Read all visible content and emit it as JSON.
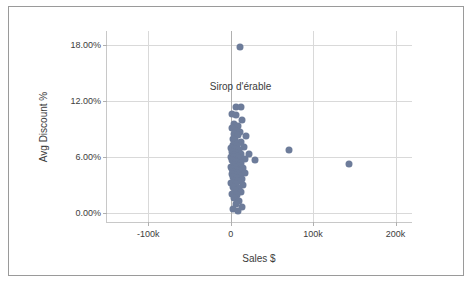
{
  "chart_data": {
    "type": "scatter",
    "title": "",
    "xlabel": "Sales $",
    "ylabel": "Avg Discount %",
    "xlim": [
      -150000,
      220000
    ],
    "ylim": [
      -0.01,
      0.195
    ],
    "grid": true,
    "legend": false,
    "point_color": "#6d7c9a",
    "xticks": [
      {
        "value": -100000,
        "label": "-100k"
      },
      {
        "value": 0,
        "label": "0"
      },
      {
        "value": 100000,
        "label": "100k"
      },
      {
        "value": 200000,
        "label": "200k"
      }
    ],
    "yticks": [
      {
        "value": 0.0,
        "label": "0.00%"
      },
      {
        "value": 0.06,
        "label": "6.00%"
      },
      {
        "value": 0.12,
        "label": "12.00%"
      },
      {
        "value": 0.18,
        "label": "18.00%"
      }
    ],
    "annotations": [
      {
        "text": "Sirop d'érable",
        "x": 12000,
        "y": 0.134
      }
    ],
    "points": [
      {
        "x": 11500,
        "y": 0.1775
      },
      {
        "x": 6500,
        "y": 0.1135
      },
      {
        "x": 12500,
        "y": 0.113
      },
      {
        "x": 2000,
        "y": 0.106
      },
      {
        "x": 7000,
        "y": 0.1045
      },
      {
        "x": 14000,
        "y": 0.1
      },
      {
        "x": 4500,
        "y": 0.095
      },
      {
        "x": 9500,
        "y": 0.093
      },
      {
        "x": 1500,
        "y": 0.0905
      },
      {
        "x": 6000,
        "y": 0.088
      },
      {
        "x": 11000,
        "y": 0.0865
      },
      {
        "x": 3500,
        "y": 0.0845
      },
      {
        "x": 8500,
        "y": 0.083
      },
      {
        "x": 19000,
        "y": 0.082
      },
      {
        "x": 2500,
        "y": 0.079
      },
      {
        "x": 5500,
        "y": 0.0775
      },
      {
        "x": 13000,
        "y": 0.076
      },
      {
        "x": 9000,
        "y": 0.0745
      },
      {
        "x": 3000,
        "y": 0.073
      },
      {
        "x": 7500,
        "y": 0.0715
      },
      {
        "x": 16500,
        "y": 0.0705
      },
      {
        "x": 1000,
        "y": 0.069
      },
      {
        "x": 5000,
        "y": 0.068
      },
      {
        "x": 10500,
        "y": 0.067
      },
      {
        "x": 71000,
        "y": 0.0675
      },
      {
        "x": 2000,
        "y": 0.0655
      },
      {
        "x": 6500,
        "y": 0.0645
      },
      {
        "x": 12000,
        "y": 0.0635
      },
      {
        "x": 22000,
        "y": 0.063
      },
      {
        "x": 3500,
        "y": 0.062
      },
      {
        "x": 8000,
        "y": 0.061
      },
      {
        "x": 500,
        "y": 0.06
      },
      {
        "x": 4500,
        "y": 0.0595
      },
      {
        "x": 10000,
        "y": 0.0585
      },
      {
        "x": 17500,
        "y": 0.058
      },
      {
        "x": 1500,
        "y": 0.057
      },
      {
        "x": 6000,
        "y": 0.056
      },
      {
        "x": 29000,
        "y": 0.0565
      },
      {
        "x": 2500,
        "y": 0.055
      },
      {
        "x": 7000,
        "y": 0.054
      },
      {
        "x": 12500,
        "y": 0.0535
      },
      {
        "x": 144000,
        "y": 0.052
      },
      {
        "x": 3500,
        "y": 0.0515
      },
      {
        "x": 8500,
        "y": 0.0505
      },
      {
        "x": 1000,
        "y": 0.0495
      },
      {
        "x": 5000,
        "y": 0.0485
      },
      {
        "x": 14500,
        "y": 0.048
      },
      {
        "x": 2000,
        "y": 0.047
      },
      {
        "x": 6500,
        "y": 0.046
      },
      {
        "x": 10500,
        "y": 0.045
      },
      {
        "x": 3000,
        "y": 0.044
      },
      {
        "x": 7500,
        "y": 0.043
      },
      {
        "x": 17000,
        "y": 0.0425
      },
      {
        "x": 1500,
        "y": 0.0415
      },
      {
        "x": 5500,
        "y": 0.0405
      },
      {
        "x": 11500,
        "y": 0.0395
      },
      {
        "x": 2500,
        "y": 0.038
      },
      {
        "x": 8000,
        "y": 0.037
      },
      {
        "x": 13500,
        "y": 0.036
      },
      {
        "x": 4000,
        "y": 0.0345
      },
      {
        "x": 9000,
        "y": 0.0335
      },
      {
        "x": 1000,
        "y": 0.032
      },
      {
        "x": 6000,
        "y": 0.031
      },
      {
        "x": 15000,
        "y": 0.03
      },
      {
        "x": 3000,
        "y": 0.028
      },
      {
        "x": 10000,
        "y": 0.0265
      },
      {
        "x": 5000,
        "y": 0.024
      },
      {
        "x": 12500,
        "y": 0.0225
      },
      {
        "x": 2000,
        "y": 0.0205
      },
      {
        "x": 7500,
        "y": 0.019
      },
      {
        "x": 4000,
        "y": 0.0155
      },
      {
        "x": 10500,
        "y": 0.013
      },
      {
        "x": 6500,
        "y": 0.0095
      },
      {
        "x": 13500,
        "y": 0.006
      },
      {
        "x": 2500,
        "y": 0.0035
      },
      {
        "x": 9000,
        "y": 0.002
      }
    ]
  }
}
